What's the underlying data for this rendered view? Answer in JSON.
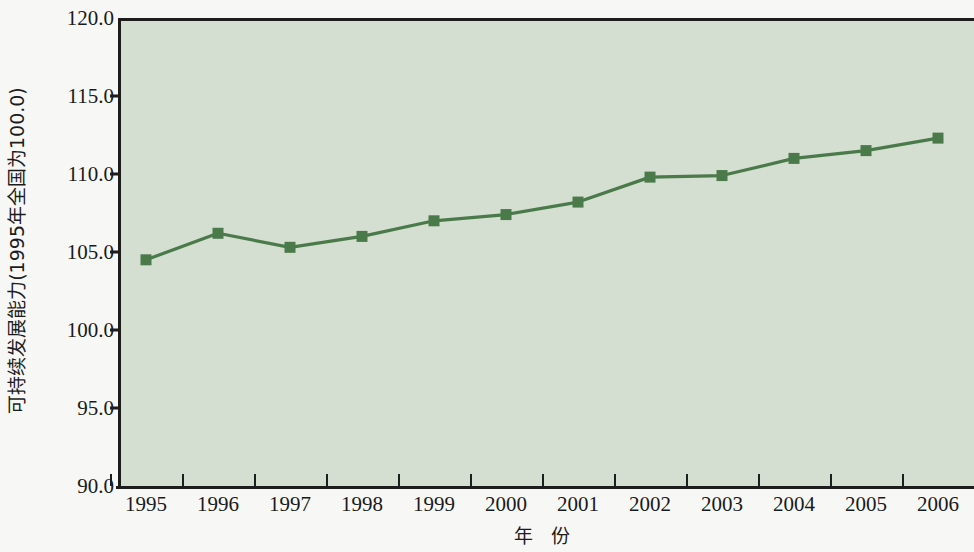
{
  "chart_data": {
    "type": "line",
    "title": "",
    "xlabel": "年 份",
    "ylabel": "可持续发展能力(1995年全国为100.0)",
    "categories": [
      "1995",
      "1996",
      "1997",
      "1998",
      "1999",
      "2000",
      "2001",
      "2002",
      "2003",
      "2004",
      "2005",
      "2006"
    ],
    "values": [
      104.5,
      106.2,
      105.3,
      106.0,
      107.0,
      107.4,
      108.2,
      109.8,
      109.9,
      111.0,
      111.5,
      112.3
    ],
    "series": [
      {
        "name": "可持续发展能力",
        "values": [
          104.5,
          106.2,
          105.3,
          106.0,
          107.0,
          107.4,
          108.2,
          109.8,
          109.9,
          111.0,
          111.5,
          112.3
        ]
      }
    ],
    "ylim": [
      90.0,
      120.0
    ],
    "ytick_labels": [
      "120.0",
      "115.0",
      "110.0",
      "105.0",
      "100.0",
      "95.0",
      "90.0"
    ],
    "ytick_values": [
      120.0,
      115.0,
      110.0,
      105.0,
      100.0,
      95.0,
      90.0
    ],
    "grid": false,
    "legend": "none",
    "marker": "square",
    "colors": {
      "line": "#4a7a4a",
      "marker": "#4a7a4a",
      "plot_background": "#d4ded1",
      "figure_background": "#f7f7f5",
      "axis": "#1d1d1d",
      "text": "#1a1a1a"
    }
  }
}
